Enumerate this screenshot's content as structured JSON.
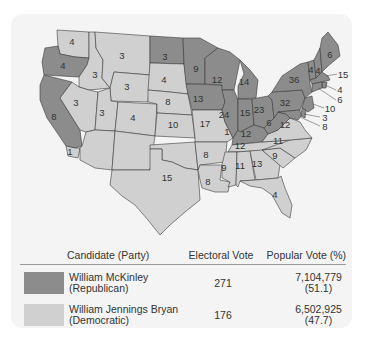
{
  "map": {
    "title": "Election of 1896",
    "colors": {
      "republican": "#8c8c8c",
      "democratic": "#d0d0d0",
      "border": "#3a3a3a"
    },
    "states": [
      {
        "name": "Washington",
        "ev": "4",
        "party": "democratic"
      },
      {
        "name": "Oregon",
        "ev": "4",
        "party": "republican"
      },
      {
        "name": "California",
        "ev": "8",
        "party": "republican"
      },
      {
        "name": "California (split)",
        "ev": "1",
        "party": "democratic"
      },
      {
        "name": "Idaho",
        "ev": "3",
        "party": "democratic"
      },
      {
        "name": "Nevada",
        "ev": "3",
        "party": "democratic"
      },
      {
        "name": "Montana",
        "ev": "3",
        "party": "democratic"
      },
      {
        "name": "Wyoming",
        "ev": "3",
        "party": "democratic"
      },
      {
        "name": "Utah",
        "ev": "3",
        "party": "democratic"
      },
      {
        "name": "Colorado",
        "ev": "4",
        "party": "democratic"
      },
      {
        "name": "North Dakota",
        "ev": "3",
        "party": "republican"
      },
      {
        "name": "South Dakota",
        "ev": "4",
        "party": "democratic"
      },
      {
        "name": "Nebraska",
        "ev": "8",
        "party": "democratic"
      },
      {
        "name": "Kansas",
        "ev": "10",
        "party": "democratic"
      },
      {
        "name": "Texas",
        "ev": "15",
        "party": "democratic"
      },
      {
        "name": "Minnesota",
        "ev": "9",
        "party": "republican"
      },
      {
        "name": "Iowa",
        "ev": "13",
        "party": "republican"
      },
      {
        "name": "Missouri",
        "ev": "17",
        "party": "democratic"
      },
      {
        "name": "Arkansas",
        "ev": "8",
        "party": "democratic"
      },
      {
        "name": "Louisiana",
        "ev": "8",
        "party": "democratic"
      },
      {
        "name": "Wisconsin",
        "ev": "12",
        "party": "republican"
      },
      {
        "name": "Illinois",
        "ev": "24",
        "party": "republican"
      },
      {
        "name": "Michigan",
        "ev": "14",
        "party": "republican"
      },
      {
        "name": "Indiana",
        "ev": "15",
        "party": "republican"
      },
      {
        "name": "Ohio",
        "ev": "23",
        "party": "republican"
      },
      {
        "name": "Kentucky",
        "ev": "12",
        "party": "republican"
      },
      {
        "name": "Kentucky (split)",
        "ev": "1",
        "party": "democratic"
      },
      {
        "name": "Tennessee",
        "ev": "12",
        "party": "democratic"
      },
      {
        "name": "Mississippi",
        "ev": "9",
        "party": "democratic"
      },
      {
        "name": "Alabama",
        "ev": "11",
        "party": "democratic"
      },
      {
        "name": "Georgia",
        "ev": "13",
        "party": "democratic"
      },
      {
        "name": "Florida",
        "ev": "4",
        "party": "democratic"
      },
      {
        "name": "South Carolina",
        "ev": "9",
        "party": "democratic"
      },
      {
        "name": "North Carolina",
        "ev": "11",
        "party": "democratic"
      },
      {
        "name": "Virginia",
        "ev": "12",
        "party": "democratic"
      },
      {
        "name": "West Virginia",
        "ev": "6",
        "party": "republican"
      },
      {
        "name": "Pennsylvania",
        "ev": "32",
        "party": "republican"
      },
      {
        "name": "New York",
        "ev": "36",
        "party": "republican"
      },
      {
        "name": "Vermont",
        "ev": "4",
        "party": "republican"
      },
      {
        "name": "New Hampshire",
        "ev": "4",
        "party": "republican"
      },
      {
        "name": "Maine",
        "ev": "6",
        "party": "republican"
      },
      {
        "name": "Massachusetts",
        "ev": "15",
        "party": "republican"
      },
      {
        "name": "Rhode Island",
        "ev": "4",
        "party": "republican"
      },
      {
        "name": "Connecticut",
        "ev": "6",
        "party": "republican"
      },
      {
        "name": "New Jersey",
        "ev": "10",
        "party": "republican"
      },
      {
        "name": "Delaware",
        "ev": "3",
        "party": "republican"
      },
      {
        "name": "Maryland",
        "ev": "8",
        "party": "republican"
      }
    ]
  },
  "legend": {
    "headers": {
      "candidate": "Candidate (Party)",
      "electoral": "Electoral Vote",
      "popular": "Popular Vote (%)"
    },
    "rows": [
      {
        "name": "William McKinley",
        "party": "(Republican)",
        "electoral": "271",
        "popular": "7,104,779",
        "percent": "(51.1)",
        "color": "#8c8c8c"
      },
      {
        "name": "William Jennings Bryan",
        "party": "(Democratic)",
        "electoral": "176",
        "popular": "6,502,925",
        "percent": "(47.7)",
        "color": "#d0d0d0"
      }
    ]
  }
}
